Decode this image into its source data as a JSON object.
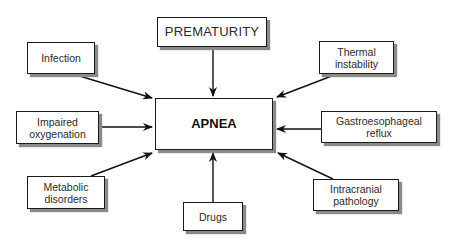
{
  "diagram": {
    "center": {
      "label": "APNEA"
    },
    "causes": {
      "prematurity": "PREMATURITY",
      "infection": "Infection",
      "impaired_oxygenation": "Impaired\noxygenation",
      "metabolic_disorders": "Metabolic\ndisorders",
      "drugs": "Drugs",
      "thermal_instability": "Thermal\ninstability",
      "gastroesophageal_reflux": "Gastroesophageal\nreflux",
      "intracranial_pathology": "Intracranial\npathology"
    },
    "edges": [
      {
        "from": "prematurity",
        "to": "center"
      },
      {
        "from": "infection",
        "to": "center"
      },
      {
        "from": "impaired_oxygenation",
        "to": "center"
      },
      {
        "from": "metabolic_disorders",
        "to": "center"
      },
      {
        "from": "drugs",
        "to": "center"
      },
      {
        "from": "thermal_instability",
        "to": "center"
      },
      {
        "from": "gastroesophageal_reflux",
        "to": "center"
      },
      {
        "from": "intracranial_pathology",
        "to": "center"
      }
    ]
  }
}
